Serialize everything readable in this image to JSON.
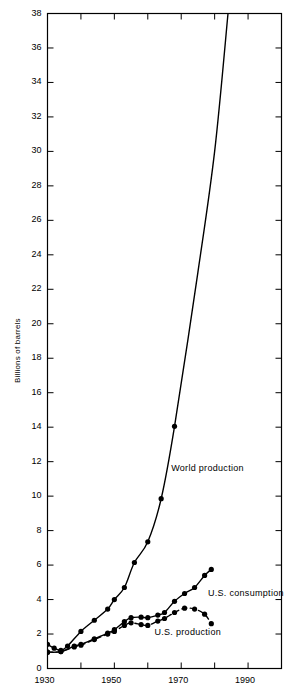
{
  "chart_data": {
    "type": "line",
    "title": "",
    "xlabel": "",
    "ylabel": "Billions of barrels",
    "xlim": [
      1930,
      2000
    ],
    "ylim": [
      0,
      38
    ],
    "x_tick_step": 10,
    "x_minor_step": 5,
    "y_tick_step": 2,
    "x_tick_labels": [
      "1930",
      "1950",
      "1970",
      "1990"
    ],
    "x_tick_label_values": [
      1930,
      1950,
      1970,
      1990
    ],
    "y_tick_labels": [
      "0",
      "2",
      "4",
      "6",
      "8",
      "10",
      "12",
      "14",
      "16",
      "18",
      "20",
      "22",
      "24",
      "26",
      "28",
      "30",
      "32",
      "34",
      "36",
      "38"
    ],
    "grid": false,
    "legend": "inline-annotations",
    "frame": true,
    "series": [
      {
        "name": "World production",
        "label": "World production",
        "style": "solid",
        "markers": true,
        "color": "#000000",
        "label_x": 1967,
        "label_y": 11.6,
        "points": [
          {
            "x": 1930,
            "y": 1.4
          },
          {
            "x": 1932,
            "y": 1.18
          },
          {
            "x": 1934,
            "y": 1.05
          },
          {
            "x": 1936,
            "y": 1.3
          },
          {
            "x": 1940,
            "y": 2.15
          },
          {
            "x": 1944,
            "y": 2.8
          },
          {
            "x": 1948,
            "y": 3.45
          },
          {
            "x": 1950,
            "y": 4.0
          },
          {
            "x": 1953,
            "y": 4.7
          },
          {
            "x": 1956,
            "y": 6.15
          },
          {
            "x": 1960,
            "y": 7.35
          },
          {
            "x": 1964,
            "y": 9.85
          },
          {
            "x": 1968,
            "y": 14.05
          },
          {
            "x": 1975,
            "y": 23.0
          },
          {
            "x": 1980,
            "y": 30.0
          },
          {
            "x": 1984,
            "y": 38.0
          }
        ]
      },
      {
        "name": "U.S. consumption",
        "label": "U.S. consumption",
        "style": "solid",
        "markers": true,
        "color": "#000000",
        "label_x": 1978,
        "label_y": 4.35,
        "points": [
          {
            "x": 1930,
            "y": 0.95
          },
          {
            "x": 1934,
            "y": 0.98
          },
          {
            "x": 1938,
            "y": 1.3
          },
          {
            "x": 1940,
            "y": 1.4
          },
          {
            "x": 1944,
            "y": 1.72
          },
          {
            "x": 1948,
            "y": 2.05
          },
          {
            "x": 1950,
            "y": 2.25
          },
          {
            "x": 1953,
            "y": 2.72
          },
          {
            "x": 1955,
            "y": 2.95
          },
          {
            "x": 1958,
            "y": 2.98
          },
          {
            "x": 1960,
            "y": 2.95
          },
          {
            "x": 1963,
            "y": 3.1
          },
          {
            "x": 1965,
            "y": 3.25
          },
          {
            "x": 1968,
            "y": 3.9
          },
          {
            "x": 1971,
            "y": 4.35
          },
          {
            "x": 1974,
            "y": 4.7
          },
          {
            "x": 1977,
            "y": 5.4
          },
          {
            "x": 1979,
            "y": 5.75
          }
        ]
      },
      {
        "name": "U.S. production",
        "label": "U.S. production",
        "style": "dashed",
        "markers": true,
        "color": "#000000",
        "label_x": 1962,
        "label_y": 2.05,
        "points": [
          {
            "x": 1930,
            "y": 0.95
          },
          {
            "x": 1934,
            "y": 0.98
          },
          {
            "x": 1938,
            "y": 1.25
          },
          {
            "x": 1940,
            "y": 1.35
          },
          {
            "x": 1944,
            "y": 1.68
          },
          {
            "x": 1948,
            "y": 2.0
          },
          {
            "x": 1950,
            "y": 2.15
          },
          {
            "x": 1953,
            "y": 2.5
          },
          {
            "x": 1955,
            "y": 2.65
          },
          {
            "x": 1958,
            "y": 2.55
          },
          {
            "x": 1960,
            "y": 2.5
          },
          {
            "x": 1963,
            "y": 2.75
          },
          {
            "x": 1965,
            "y": 2.9
          },
          {
            "x": 1968,
            "y": 3.25
          },
          {
            "x": 1971,
            "y": 3.5
          },
          {
            "x": 1974,
            "y": 3.45
          },
          {
            "x": 1977,
            "y": 3.15
          },
          {
            "x": 1979,
            "y": 2.6
          }
        ]
      }
    ]
  }
}
